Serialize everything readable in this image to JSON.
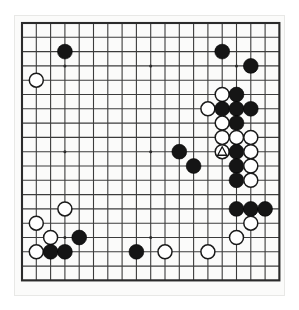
{
  "figure": {
    "kind": "go-board-diagram",
    "title": "Go board position diagram",
    "board_size": 19,
    "background_color": "#ffffff",
    "board_color": "#fbfbfa",
    "line_color": "#3c3c3c",
    "edge_color": "#2b2b2b",
    "black_color": "#151515",
    "white_color": "#ffffff"
  },
  "geometry": {
    "origin_x": 7,
    "origin_y": 7,
    "spacing": 14.3,
    "stone_radius": 7.4,
    "star_radius": 1.5,
    "lines": 19
  },
  "star_points": [
    {
      "col": 4,
      "row": 4
    },
    {
      "col": 10,
      "row": 4
    },
    {
      "col": 16,
      "row": 4
    },
    {
      "col": 4,
      "row": 10
    },
    {
      "col": 10,
      "row": 10
    },
    {
      "col": 16,
      "row": 10
    },
    {
      "col": 4,
      "row": 16
    },
    {
      "col": 10,
      "row": 16
    },
    {
      "col": 16,
      "row": 16
    }
  ],
  "stones": [
    {
      "color": "black",
      "col": 4,
      "row": 3
    },
    {
      "color": "white",
      "col": 2,
      "row": 5
    },
    {
      "color": "black",
      "col": 15,
      "row": 3
    },
    {
      "color": "black",
      "col": 17,
      "row": 4
    },
    {
      "color": "white",
      "col": 15,
      "row": 6
    },
    {
      "color": "black",
      "col": 16,
      "row": 6
    },
    {
      "color": "white",
      "col": 14,
      "row": 7
    },
    {
      "color": "black",
      "col": 15,
      "row": 7
    },
    {
      "color": "black",
      "col": 16,
      "row": 7
    },
    {
      "color": "black",
      "col": 17,
      "row": 7
    },
    {
      "color": "white",
      "col": 15,
      "row": 8
    },
    {
      "color": "black",
      "col": 16,
      "row": 8
    },
    {
      "color": "white",
      "col": 15,
      "row": 9
    },
    {
      "color": "white",
      "col": 16,
      "row": 9
    },
    {
      "color": "white",
      "col": 17,
      "row": 9
    },
    {
      "color": "white",
      "col": 15,
      "row": 10
    },
    {
      "color": "black",
      "col": 16,
      "row": 10
    },
    {
      "color": "white",
      "col": 17,
      "row": 10
    },
    {
      "color": "black",
      "col": 12,
      "row": 10
    },
    {
      "color": "black",
      "col": 13,
      "row": 11
    },
    {
      "color": "black",
      "col": 16,
      "row": 11
    },
    {
      "color": "white",
      "col": 17,
      "row": 11
    },
    {
      "color": "black",
      "col": 16,
      "row": 12
    },
    {
      "color": "white",
      "col": 17,
      "row": 12
    },
    {
      "color": "black",
      "col": 16,
      "row": 14
    },
    {
      "color": "black",
      "col": 17,
      "row": 14
    },
    {
      "color": "black",
      "col": 18,
      "row": 14
    },
    {
      "color": "white",
      "col": 17,
      "row": 15
    },
    {
      "color": "white",
      "col": 16,
      "row": 16
    },
    {
      "color": "white",
      "col": 14,
      "row": 17
    },
    {
      "color": "white",
      "col": 4,
      "row": 14
    },
    {
      "color": "white",
      "col": 2,
      "row": 15
    },
    {
      "color": "white",
      "col": 3,
      "row": 16
    },
    {
      "color": "black",
      "col": 5,
      "row": 16
    },
    {
      "color": "white",
      "col": 2,
      "row": 17
    },
    {
      "color": "black",
      "col": 3,
      "row": 17
    },
    {
      "color": "black",
      "col": 4,
      "row": 17
    },
    {
      "color": "black",
      "col": 9,
      "row": 17
    },
    {
      "color": "white",
      "col": 11,
      "row": 17
    }
  ],
  "markers": [
    {
      "shape": "triangle",
      "col": 15,
      "row": 10,
      "on_stone_color": "white",
      "label": "marked white stone"
    }
  ],
  "counts": {
    "black_stones": 20,
    "white_stones": 19,
    "total_stones": 39
  }
}
